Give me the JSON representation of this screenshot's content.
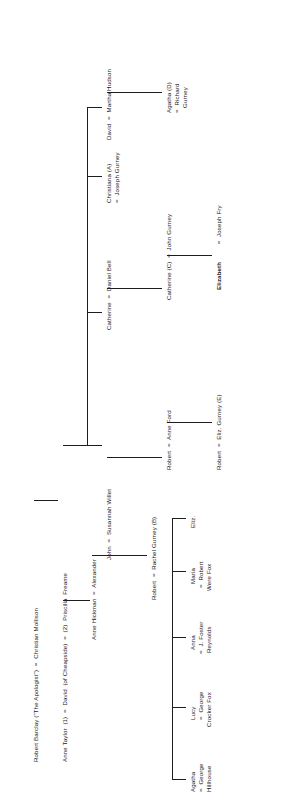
{
  "document": {
    "kind": "genealogical-pedigree-chart",
    "orientation": "rotated-90-ccw",
    "ink_color": "#1d1d1d",
    "paper_color": "#ffffff"
  },
  "generations": [
    {
      "id": "g1",
      "label": "generation-1",
      "nodes": [
        {
          "id": "g1n1",
          "text": "Robert Barclay (\"The Apologist\")  =  Christian Mollison",
          "bold": false
        }
      ]
    },
    {
      "id": "g2",
      "label": "generation-2",
      "nodes": [
        {
          "id": "g2n1",
          "text": "Anne Taylor  (1)  =  David  (of Cheapside)  =  (2)  Priscilla  Freame",
          "bold": false
        }
      ]
    },
    {
      "id": "g3",
      "label": "generation-3",
      "nodes": [
        {
          "id": "g3n1",
          "text": "Anne Hickman  =  Alexander",
          "bold": false
        },
        {
          "id": "g3n2",
          "text": "John  =  Susannah Willet",
          "bold": false
        },
        {
          "id": "g3n3",
          "text": "Catherine  =  Daniel Bell",
          "bold": false
        },
        {
          "id": "g3n4",
          "text": "Christiana (A)",
          "bold": false
        },
        {
          "id": "g3n4b",
          "text": "=  Joseph Gurney",
          "bold": false
        },
        {
          "id": "g3n5",
          "text": "David  =  Martha Hudson",
          "bold": false
        }
      ]
    },
    {
      "id": "g4",
      "label": "generation-4",
      "nodes": [
        {
          "id": "g4n1",
          "text": "Robert  =  Rachel Gurney (B)",
          "bold": false
        },
        {
          "id": "g4n2",
          "text": "Robert  =  Anne Ford",
          "bold": false
        },
        {
          "id": "g4n3",
          "text": "Catherine (C)  =  John Gurney",
          "bold": false
        },
        {
          "id": "g4n4",
          "text": "Agatha (D)",
          "bold": false
        },
        {
          "id": "g4n4b",
          "text": "=  Richard",
          "bold": false
        },
        {
          "id": "g4n4c",
          "text": "Gurney",
          "bold": false
        }
      ]
    },
    {
      "id": "g5",
      "label": "generation-5",
      "nodes": [
        {
          "id": "g5n1",
          "text": "Agatha",
          "bold": false
        },
        {
          "id": "g5n1b",
          "text": "=  George",
          "bold": false
        },
        {
          "id": "g5n1c",
          "text": "Hillhouse",
          "bold": false
        },
        {
          "id": "g5n2",
          "text": "Lucy",
          "bold": false
        },
        {
          "id": "g5n2b",
          "text": "=  George",
          "bold": false
        },
        {
          "id": "g5n2c",
          "text": "Crocker Fox",
          "bold": false
        },
        {
          "id": "g5n3",
          "text": "Anna",
          "bold": false
        },
        {
          "id": "g5n3b",
          "text": "=  J. Foster",
          "bold": false
        },
        {
          "id": "g5n3c",
          "text": "Reynolds",
          "bold": false
        },
        {
          "id": "g5n4",
          "text": "Maria",
          "bold": false
        },
        {
          "id": "g5n4b",
          "text": "=  Robert",
          "bold": false
        },
        {
          "id": "g5n4c",
          "text": "Were Fox",
          "bold": false
        },
        {
          "id": "g5n5",
          "text": "Eliz.",
          "bold": false
        },
        {
          "id": "g5n6",
          "text": "Robert  =  Eliz. Gurney (E)",
          "bold": false
        },
        {
          "id": "g5n7a",
          "text": "Elizabeth",
          "bold": true
        },
        {
          "id": "g5n7b",
          "text": "  =  Joseph Fry",
          "bold": false
        }
      ]
    }
  ]
}
